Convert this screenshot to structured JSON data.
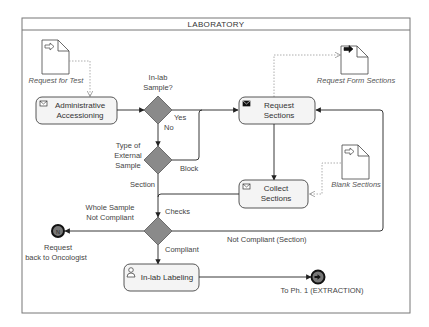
{
  "pool": {
    "title": "LABORATORY"
  },
  "data_objects": {
    "request_for_test": {
      "label": "Request for Test",
      "icon": "input-arrow-icon"
    },
    "request_form_sections": {
      "label": "Request Form Sections",
      "icon": "output-arrow-icon"
    },
    "blank_sections": {
      "label": "Blank Sections",
      "icon": "input-arrow-icon"
    }
  },
  "tasks": {
    "administrative_accessioning": {
      "line1": "Administrative",
      "line2": "Accessioning",
      "icon": "envelope-icon"
    },
    "request_sections": {
      "line1": "Request",
      "line2": "Sections",
      "icon": "filled-envelope-icon"
    },
    "collect_sections": {
      "line1": "Collect",
      "line2": "Sections",
      "icon": "envelope-icon"
    },
    "in_lab_labeling": {
      "line1": "In-lab Labeling",
      "icon": "user-icon"
    }
  },
  "gateways": {
    "in_lab_sample": {
      "line1": "In-lab",
      "line2": "Sample?"
    },
    "type_external_sample": {
      "line1": "Type of",
      "line2": "External",
      "line3": "Sample"
    },
    "checks": {
      "label": "Checks"
    }
  },
  "flow_labels": {
    "yes": "Yes",
    "no": "No",
    "block": "Block",
    "section": "Section",
    "whole_sample_not_compliant_1": "Whole Sample",
    "whole_sample_not_compliant_2": "Not Compliant",
    "compliant": "Compliant",
    "not_compliant_section": "Not Compliant (Section)"
  },
  "end_events": {
    "request_back": {
      "line1": "Request",
      "line2": "back to Oncologist",
      "glyph": "N"
    },
    "to_ph1": {
      "label": "To Ph. 1 (EXTRACTION)"
    }
  },
  "colors": {
    "gateway_fill": "#8a8a8a",
    "task_fill": "#f4f4f4",
    "stroke": "#444444",
    "association": "#9a9a9a"
  }
}
